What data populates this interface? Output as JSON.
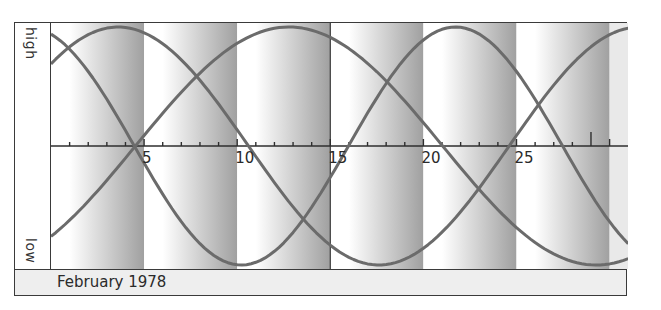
{
  "chart_data": {
    "type": "line",
    "title": "",
    "xlabel": "February 1978",
    "ylabel": "",
    "y_tick_labels": [
      "high",
      "low"
    ],
    "x_tick_labels": [
      "5",
      "10",
      "15",
      "20",
      "25"
    ],
    "x_range": [
      0,
      31
    ],
    "y_range": [
      -1,
      1
    ],
    "grid": false,
    "legend": null,
    "highlight_tick_day": 29,
    "bands": {
      "width_days": 5,
      "style": "gradient white-to-gray, repeating"
    },
    "series": [
      {
        "name": "curve-23-day",
        "period_days": 23,
        "value_day0": 0.94,
        "zero_crossing_descending_day": 4.5,
        "peak_day": 21.4,
        "trough_day": 10.2
      },
      {
        "name": "curve-28-day",
        "period_days": 28,
        "value_day0": 0.69,
        "peak_day": 3.6,
        "trough_day": 17.6,
        "zero_crossing_ascending_day": 24.6
      },
      {
        "name": "curve-33-day",
        "period_days": 33,
        "value_day0": -0.76,
        "zero_crossing_ascending_day": 4.5,
        "peak_day": 12.75,
        "trough_day": 29.25
      }
    ],
    "x": [
      0,
      2,
      4,
      6,
      8,
      10,
      12,
      14,
      16,
      18,
      20,
      22,
      24,
      26,
      28,
      30
    ],
    "series_values": {
      "curve-23-day": [
        0.94,
        0.63,
        0.14,
        -0.4,
        -0.82,
        -1.0,
        -0.89,
        -0.52,
        -0.0,
        0.52,
        0.89,
        1.0,
        0.82,
        0.4,
        -0.14,
        -0.63
      ],
      "curve-28-day": [
        0.69,
        0.97,
        0.99,
        0.75,
        0.31,
        -0.2,
        -0.66,
        -0.95,
        -0.99,
        -0.78,
        -0.36,
        0.15,
        0.62,
        0.93,
        1.0,
        0.81
      ],
      "curve-33-day": [
        -0.76,
        -0.44,
        -0.06,
        0.33,
        0.68,
        0.92,
        1.0,
        0.92,
        0.66,
        0.3,
        -0.09,
        -0.46,
        -0.78,
        -0.96,
        -0.99,
        -0.86
      ]
    }
  },
  "axis": {
    "high_label": "high",
    "low_label": "low",
    "tick_labels": [
      {
        "day": 5,
        "label": "5"
      },
      {
        "day": 10,
        "label": "10"
      },
      {
        "day": 15,
        "label": "15"
      },
      {
        "day": 20,
        "label": "20"
      },
      {
        "day": 25,
        "label": "25"
      }
    ]
  },
  "footer": {
    "label": "February 1978"
  },
  "colors": {
    "frame": "#3a3a3a",
    "curve": "#6b6b6b",
    "band_dark": "#9c9c9c",
    "band_light": "#ffffff",
    "footer_bg": "#eeeeee",
    "text": "#2a2a2a"
  }
}
